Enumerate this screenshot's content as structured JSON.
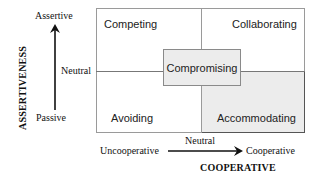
{
  "diagram": {
    "type": "conflict-styles-grid",
    "y_axis": {
      "title": "ASSERTIVENESS",
      "top_label": "Assertive",
      "middle_label": "Neutral",
      "bottom_label": "Passive"
    },
    "x_axis": {
      "title": "COOPERATIVE",
      "left_label": "Uncooperative",
      "middle_label": "Neutral",
      "right_label": "Cooperative"
    },
    "quadrants": {
      "top_left": "Competing",
      "top_right": "Collaborating",
      "bottom_left": "Avoiding",
      "bottom_right": "Accommodating",
      "center": "Compromising"
    },
    "colors": {
      "shaded_fill": "#ececec",
      "grid_line": "#9a9a9a",
      "arrow": "#111111"
    }
  }
}
